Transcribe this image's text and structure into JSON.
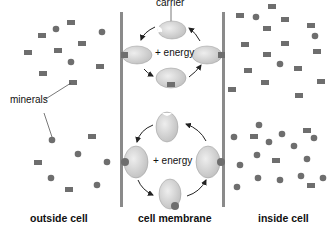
{
  "labels": {
    "carrier": "carrier",
    "minerals": "minerals",
    "energy_top": "+ energy",
    "energy_bottom": "+ energy",
    "outside": "outside cell",
    "membrane": "cell membrane",
    "inside": "inside cell"
  },
  "colors": {
    "mineral": "#6e6e6e",
    "carrier_fill": "#d4d4d4",
    "membrane": "#8a8a8a",
    "arrow": "#222222"
  },
  "legend": {
    "square_particles": "minerals transported by top carrier cycle",
    "round_particles": "minerals transported by bottom carrier cycle"
  }
}
